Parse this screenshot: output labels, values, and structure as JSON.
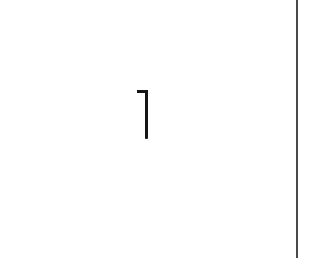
{
  "page": {
    "number": "1",
    "background": "#ffffff",
    "text_color": "#161616",
    "rule_color": "#4a4a4a"
  }
}
